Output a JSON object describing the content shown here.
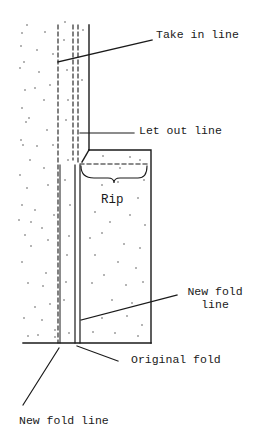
{
  "diagram": {
    "type": "sewing hem alteration diagram",
    "labels": {
      "take_in_line": "Take in line",
      "let_out_line": "Let out line",
      "rip": "Rip",
      "new_fold_line_right_1": "New fold",
      "new_fold_line_right_2": "line",
      "original_fold": "Original fold",
      "new_fold_line_bottom": "New fold line"
    },
    "colors": {
      "ink": "#1a1a1a",
      "background": "#ffffff"
    }
  }
}
